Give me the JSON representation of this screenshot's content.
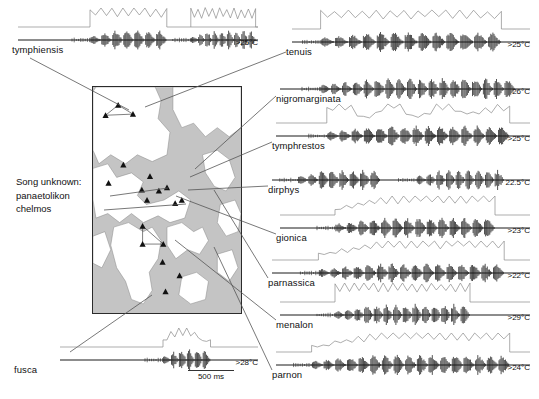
{
  "figure": {
    "title_text": "",
    "scalebar": {
      "label": "500 ms",
      "width_px": 46
    },
    "note": {
      "line1": "Song unknown:",
      "line2": "panaetolikon",
      "line3": "chelmos"
    },
    "colors": {
      "ink": "#111111",
      "trace_black": "#1a1a1a",
      "trace_gray": "#8a8a8a",
      "sea": "#c4c4c4",
      "land": "#ffffff",
      "frame": "#2b2b2b",
      "leader": "#555555"
    }
  },
  "panels": [
    {
      "name": "tymphiensis",
      "label": "tymphiensis",
      "temp": ">25°C",
      "x": 18,
      "y": 40,
      "w": 240,
      "label_x": 12,
      "label_y": 44,
      "envelope": true,
      "env_style": "two-bursts",
      "burst_start": 0.3,
      "burst_end": 0.62,
      "pulse_count": 7,
      "amp": 0.92,
      "burst2_start": 0.72,
      "burst2_end": 0.99,
      "pulse_count2": 9
    },
    {
      "name": "tenuis",
      "label": "tenuis",
      "temp": ">25°C",
      "x": 292,
      "y": 42,
      "w": 238,
      "label_x": 286,
      "label_y": 46,
      "envelope": true,
      "env_style": "plateau",
      "burst_start": 0.12,
      "burst_end": 0.88,
      "pulse_count": 13,
      "amp": 0.95
    },
    {
      "name": "nigromarginata",
      "label": "nigromarginata",
      "temp": "26°C",
      "x": 280,
      "y": 89,
      "w": 250,
      "label_x": 276,
      "label_y": 93,
      "envelope": false,
      "env_style": "none",
      "burst_start": 0.16,
      "burst_end": 0.94,
      "pulse_count": 18,
      "amp": 1.0
    },
    {
      "name": "tymphrestos",
      "label": "tymphrestos",
      "temp": ">25°C",
      "x": 276,
      "y": 136,
      "w": 254,
      "label_x": 272,
      "label_y": 140,
      "envelope": true,
      "env_style": "rough",
      "burst_start": 0.2,
      "burst_end": 0.92,
      "pulse_count": 15,
      "amp": 0.95
    },
    {
      "name": "dirphys",
      "label": "dirphys",
      "temp": "22.5°C",
      "x": 272,
      "y": 180,
      "w": 258,
      "label_x": 268,
      "label_y": 184,
      "envelope": false,
      "env_style": "none",
      "burst_start": 0.1,
      "burst_end": 0.42,
      "pulse_count": 8,
      "amp": 0.95,
      "burst2_start": 0.56,
      "burst2_end": 0.9,
      "pulse_count2": 9
    },
    {
      "name": "gionica",
      "label": "gionica",
      "temp": ">23°C",
      "x": 280,
      "y": 228,
      "w": 250,
      "label_x": 276,
      "label_y": 232,
      "envelope": true,
      "env_style": "ramp",
      "burst_start": 0.22,
      "burst_end": 0.86,
      "pulse_count": 14,
      "amp": 0.98
    },
    {
      "name": "parnassica",
      "label": "parnassica",
      "temp": ">22°C",
      "x": 272,
      "y": 273,
      "w": 258,
      "label_x": 268,
      "label_y": 277,
      "envelope": true,
      "env_style": "ramp",
      "burst_start": 0.18,
      "burst_end": 0.9,
      "pulse_count": 16,
      "amp": 0.9
    },
    {
      "name": "menalon",
      "label": "menalon",
      "temp": ">29°C",
      "x": 280,
      "y": 315,
      "w": 250,
      "label_x": 276,
      "label_y": 319,
      "envelope": true,
      "env_style": "plateau",
      "burst_start": 0.22,
      "burst_end": 0.76,
      "pulse_count": 14,
      "amp": 1.0
    },
    {
      "name": "parnon",
      "label": "parnon",
      "temp": ">24°C",
      "x": 276,
      "y": 365,
      "w": 254,
      "label_x": 272,
      "label_y": 369,
      "envelope": true,
      "env_style": "ramp",
      "burst_start": 0.14,
      "burst_end": 0.92,
      "pulse_count": 17,
      "amp": 0.95
    },
    {
      "name": "fusca",
      "label": "fusca",
      "temp": ">28°C",
      "x": 60,
      "y": 360,
      "w": 198,
      "label_x": 14,
      "label_y": 364,
      "envelope": true,
      "env_style": "short",
      "burst_start": 0.52,
      "burst_end": 0.76,
      "pulse_count": 6,
      "amp": 1.0
    }
  ],
  "map": {
    "x": 92,
    "y": 86,
    "w": 148,
    "h": 226,
    "markers": [
      {
        "x": 0.17,
        "y": 0.08
      },
      {
        "x": 0.27,
        "y": 0.12
      },
      {
        "x": 0.085,
        "y": 0.125
      },
      {
        "x": 0.205,
        "y": 0.345
      },
      {
        "x": 0.105,
        "y": 0.425
      },
      {
        "x": 0.385,
        "y": 0.395
      },
      {
        "x": 0.33,
        "y": 0.455
      },
      {
        "x": 0.445,
        "y": 0.46
      },
      {
        "x": 0.5,
        "y": 0.445
      },
      {
        "x": 0.365,
        "y": 0.5
      },
      {
        "x": 0.555,
        "y": 0.515
      },
      {
        "x": 0.6,
        "y": 0.5
      },
      {
        "x": 0.335,
        "y": 0.615
      },
      {
        "x": 0.335,
        "y": 0.695
      },
      {
        "x": 0.475,
        "y": 0.695
      },
      {
        "x": 0.47,
        "y": 0.775
      },
      {
        "x": 0.585,
        "y": 0.835
      },
      {
        "x": 0.49,
        "y": 0.905
      }
    ],
    "links": [
      {
        "from": 0,
        "to": 1
      },
      {
        "from": 1,
        "to": 2
      },
      {
        "from": 2,
        "to": 0
      },
      {
        "from": 12,
        "to": 13
      },
      {
        "from": 13,
        "to": 14
      },
      {
        "from": 14,
        "to": 12
      }
    ]
  },
  "leaders": [
    {
      "name": "leader-tymphiensis",
      "x1": 30,
      "y1": 58,
      "x2": 129,
      "y2": 110
    },
    {
      "name": "leader-tenuis",
      "x1": 286,
      "y1": 52,
      "x2": 145,
      "y2": 107
    },
    {
      "name": "leader-nigromarginata",
      "x1": 276,
      "y1": 96,
      "x2": 195,
      "y2": 169
    },
    {
      "name": "leader-tymphrestos",
      "x1": 272,
      "y1": 142,
      "x2": 190,
      "y2": 177
    },
    {
      "name": "leader-dirphys",
      "x1": 268,
      "y1": 186,
      "x2": 188,
      "y2": 190
    },
    {
      "name": "leader-gionica",
      "x1": 276,
      "y1": 234,
      "x2": 176,
      "y2": 196
    },
    {
      "name": "leader-parnassica",
      "x1": 268,
      "y1": 278,
      "x2": 214,
      "y2": 190
    },
    {
      "name": "leader-menalon",
      "x1": 276,
      "y1": 320,
      "x2": 175,
      "y2": 240
    },
    {
      "name": "leader-parnon",
      "x1": 272,
      "y1": 370,
      "x2": 214,
      "y2": 247
    },
    {
      "name": "leader-fusca",
      "x1": 70,
      "y1": 352,
      "x2": 152,
      "y2": 295
    },
    {
      "name": "leader-note-panaetolikon",
      "x1": 110,
      "y1": 196,
      "x2": 168,
      "y2": 188
    },
    {
      "name": "leader-note-chelmos",
      "x1": 104,
      "y1": 210,
      "x2": 186,
      "y2": 204
    }
  ]
}
